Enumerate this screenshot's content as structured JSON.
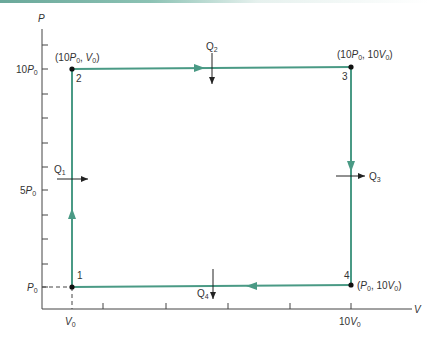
{
  "diagram": {
    "type": "P-V cycle diagram",
    "axes": {
      "y_label": "P",
      "x_label": "V",
      "y_ticks": [
        "10P0",
        "5P0",
        "P0"
      ],
      "x_ticks": [
        "V0",
        "10V0"
      ]
    },
    "points": [
      {
        "id": "1",
        "label": "1",
        "coords": ""
      },
      {
        "id": "2",
        "label": "2",
        "coords": "(10P0, V0)"
      },
      {
        "id": "3",
        "label": "3",
        "coords": "(10P0, 10V0)"
      },
      {
        "id": "4",
        "label": "4",
        "coords": "(P0, 10V0)"
      }
    ],
    "heat": [
      {
        "id": "Q1",
        "label": "Q",
        "sub": "1",
        "direction": "in"
      },
      {
        "id": "Q2",
        "label": "Q",
        "sub": "2",
        "direction": "out"
      },
      {
        "id": "Q3",
        "label": "Q",
        "sub": "3",
        "direction": "out"
      },
      {
        "id": "Q4",
        "label": "Q",
        "sub": "4",
        "direction": "out"
      }
    ],
    "colors": {
      "path": "#4a9a85",
      "axis": "#333333",
      "point": "#111111"
    }
  }
}
